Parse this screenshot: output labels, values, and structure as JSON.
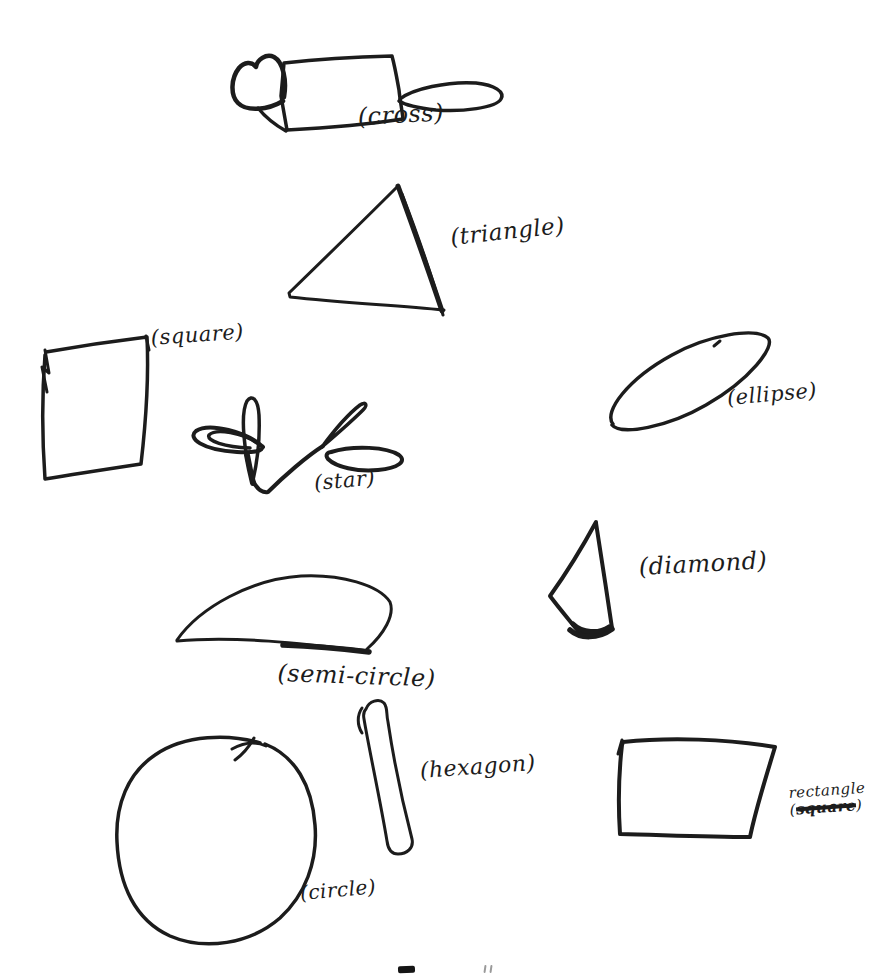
{
  "page": {
    "paper_color": "#ffffff",
    "ink_color": "#1c1c1c"
  },
  "labels": {
    "cross": "(cross)",
    "triangle": "(triangle)",
    "square": "(square)",
    "ellipse": "(ellipse)",
    "star": "(star)",
    "diamond": "(diamond)",
    "semi_circle": "(semi-circle)",
    "hexagon": "(hexagon)",
    "circle": "(circle)",
    "rectangle_line1": "rectangle",
    "rectangle_open": "(",
    "rectangle_struck": "square",
    "rectangle_close": ")"
  },
  "caption_fragment": {
    "note": "top edge of cut-off printed text at bottom of scan"
  },
  "shapes": [
    {
      "name": "cross-drawing",
      "strokes": [
        {
          "d": "M284,63 C320,59 356,57 392,56 C395,67 397,79 399,90 C400,100 402,110 403,119 C364,125 325,128 287,130 C285,119 283,107 281,96 C282,85 283,74 284,63 Z",
          "w": 3.5
        },
        {
          "d": "M283,101 C268,110 247,112 238,103 C230,95 231,78 239,68 C244,62 252,61 256,67 C257,60 266,53 274,57 C283,62 287,80 284,97",
          "w": 4.5
        },
        {
          "d": "M258,108 C266,118 277,126 286,131",
          "w": 3.5
        },
        {
          "d": "M400,99 C412,89 448,81 476,83 C495,85 505,92 501,99 C496,108 462,112 436,110 C418,108 405,105 399,101",
          "w": 3.5
        }
      ]
    },
    {
      "name": "triangle-drawing",
      "strokes": [
        {
          "d": "M397,187 C365,219 325,258 289,293 L290,297 C343,303 395,305 444,310",
          "w": 3
        },
        {
          "d": "M398,186 C410,219 429,272 442,311",
          "w": 5
        },
        {
          "d": "M402,194 C415,228 432,276 443,315",
          "w": 3
        }
      ]
    },
    {
      "name": "square-drawing",
      "strokes": [
        {
          "d": "M46,352 C80,346 114,341 147,337 C149,379 146,421 141,464 C108,469 75,474 45,479 C42,437 42,394 45,355",
          "w": 3.5
        },
        {
          "d": "M45,350 L49,373 L42,367 L47,392",
          "w": 3
        },
        {
          "d": "M146,336 L149,350",
          "w": 3
        }
      ]
    },
    {
      "name": "ellipse-drawing",
      "strokes": [
        {
          "d": "M613,424 C603,412 628,379 672,355 C708,335 755,327 768,338 C776,346 750,380 706,405 C668,427 621,436 612,425 Z",
          "w": 3.5
        },
        {
          "d": "M714,346 L720,341",
          "w": 3
        }
      ]
    },
    {
      "name": "star-drawing",
      "strokes": [
        {
          "d": "M263,447 C247,432 209,422 196,431 C187,438 202,450 237,452 C254,453 264,451 262,446 Z",
          "w": 4
        },
        {
          "d": "M257,443 C243,433 216,428 209,435 C206,441 225,447 250,448",
          "w": 3.5
        },
        {
          "d": "M252,479 C244,452 240,414 247,401 C252,394 258,399 259,415 C260,438 257,463 253,480 Z",
          "w": 3.5
        },
        {
          "d": "M247,455 C249,466 251,475 253,483",
          "w": 6
        },
        {
          "d": "M253,481 C257,489 262,493 268,492 C283,477 307,456 323,446",
          "w": 4
        },
        {
          "d": "M323,446 C337,434 354,419 363,410 C368,405 366,401 360,405 C347,415 333,432 322,447 Z",
          "w": 3.5
        },
        {
          "d": "M331,452 C354,445 387,447 399,455 C407,461 399,468 378,470 C357,472 336,467 328,459 C325,455 327,452 332,452 Z",
          "w": 4
        }
      ]
    },
    {
      "name": "diamond-drawing",
      "strokes": [
        {
          "d": "M596,522 C583,546 565,575 550,596 C559,608 570,621 578,631 C589,637 603,634 612,628 C607,594 601,555 596,523 Z",
          "w": 4
        },
        {
          "d": "M570,630 C580,639 598,639 612,629",
          "w": 5.5
        },
        {
          "d": "M573,624 C582,633 599,634 609,627",
          "w": 5
        }
      ]
    },
    {
      "name": "semi-circle-drawing",
      "strokes": [
        {
          "d": "M177,640 C200,607 252,579 301,576 C341,574 379,585 390,602 C395,615 384,634 367,649",
          "w": 3
        },
        {
          "d": "M177,641 C235,636 300,643 369,651",
          "w": 3
        },
        {
          "d": "M283,645 C312,646 345,649 369,652",
          "w": 5.5
        }
      ]
    },
    {
      "name": "hexagon-drawing",
      "strokes": [
        {
          "d": "M366,709 C369,701 379,698 384,703 C388,708 386,714 388,722 C394,762 405,812 412,839 C414,848 407,854 398,854 C391,854 388,849 387,841 C380,799 369,749 364,719 C363,714 364,711 366,709 Z",
          "w": 3
        },
        {
          "d": "M362,733 C357,725 357,715 362,708",
          "w": 3
        }
      ]
    },
    {
      "name": "circle-drawing",
      "strokes": [
        {
          "d": "M260,743 C230,734 185,734 155,755 C128,773 115,805 117,842 C119,885 135,920 170,936 C205,951 250,944 280,918 C305,895 318,862 315,825 C312,785 295,756 265,744",
          "w": 3.5
        },
        {
          "d": "M232,749 C243,743 255,741 266,746",
          "w": 3
        },
        {
          "d": "M254,738 C249,747 242,755 235,760",
          "w": 3
        }
      ]
    },
    {
      "name": "rectangle-drawing",
      "strokes": [
        {
          "d": "M623,742 C670,737 727,739 775,747 C766,777 756,808 750,837 C707,837 663,835 620,834 C618,804 619,771 622,745 Z",
          "w": 4
        },
        {
          "d": "M622,740 L618,754",
          "w": 3
        }
      ]
    }
  ]
}
